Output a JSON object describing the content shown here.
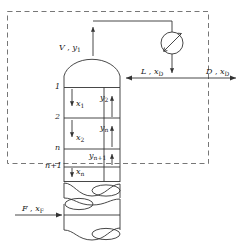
{
  "figure": {
    "type": "process-flow-diagram"
  },
  "labels": {
    "vapor_overhead": {
      "stream": "V",
      "comp": "y",
      "sub": "1",
      "text": "V , y1"
    },
    "reflux": {
      "stream": "L",
      "comp": "x",
      "sub": "D",
      "text": "L , xD"
    },
    "distillate": {
      "stream": "D",
      "comp": "x",
      "sub": "D",
      "text": "D , xD"
    },
    "feed": {
      "stream": "F",
      "comp": "x",
      "sub": "F",
      "text": "F , xF"
    },
    "separator": ","
  },
  "trays": [
    {
      "id": "tray-1",
      "number": "1"
    },
    {
      "id": "tray-2",
      "number": "2"
    },
    {
      "id": "tray-n",
      "number": "n"
    },
    {
      "id": "tray-n1",
      "number": "n+1"
    }
  ],
  "liquid_streams": [
    {
      "id": "x1",
      "comp": "x",
      "sub": "1"
    },
    {
      "id": "x2",
      "comp": "x",
      "sub": "2"
    },
    {
      "id": "xn",
      "comp": "x",
      "sub": "n"
    }
  ],
  "vapor_streams": [
    {
      "id": "y2",
      "comp": "y",
      "sub": "2"
    },
    {
      "id": "yn",
      "comp": "y",
      "sub": "n"
    },
    {
      "id": "yn1",
      "comp": "y",
      "sub": "n+1"
    }
  ],
  "equipment": [
    {
      "id": "condenser",
      "icon": "heat-exchanger-icon"
    },
    {
      "id": "column",
      "icon": "column-vessel-icon"
    },
    {
      "id": "break-upper",
      "icon": "break-symbol-icon"
    },
    {
      "id": "break-lower",
      "icon": "break-symbol-icon"
    }
  ],
  "boundary": {
    "id": "control-volume",
    "style": "dashed"
  },
  "colors": {
    "line": "#333333",
    "dash": "#777777",
    "text": "#1a1a1a",
    "background": "#ffffff"
  }
}
